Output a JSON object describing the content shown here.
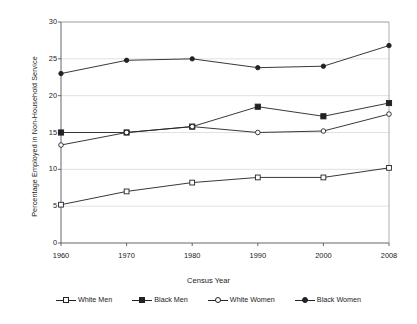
{
  "chart_data": {
    "type": "line",
    "title": "",
    "xlabel": "Census Year",
    "ylabel": "Percentage Employed in Non-Household Service",
    "categories": [
      "1960",
      "1970",
      "1980",
      "1990",
      "2000",
      "2008"
    ],
    "x": [
      1960,
      1970,
      1980,
      1990,
      2000,
      2008
    ],
    "ylim": [
      0,
      30
    ],
    "yticks": [
      "0",
      "5",
      "10",
      "15",
      "20",
      "25",
      "30"
    ],
    "ytick_values": [
      0,
      5,
      10,
      15,
      20,
      25,
      30
    ],
    "grid": true,
    "legend_position": "bottom",
    "series": [
      {
        "name": "White Men",
        "marker": "square-open",
        "color": "#222222",
        "values": [
          5.2,
          7.0,
          8.2,
          8.9,
          8.9,
          10.2
        ]
      },
      {
        "name": "Black Men",
        "marker": "square-filled",
        "color": "#222222",
        "values": [
          15.0,
          15.0,
          15.8,
          18.5,
          17.2,
          19.0
        ]
      },
      {
        "name": "White Women",
        "marker": "circle-open",
        "color": "#222222",
        "values": [
          13.3,
          15.0,
          15.8,
          15.0,
          15.2,
          17.5
        ]
      },
      {
        "name": "Black Women",
        "marker": "circle-filled",
        "color": "#222222",
        "values": [
          23.0,
          24.8,
          25.0,
          23.8,
          24.0,
          26.8
        ]
      }
    ]
  },
  "axis": {
    "y_title": "Percentage Employed in Non-Household Service",
    "x_title": "Census Year"
  },
  "legend": {
    "items": [
      {
        "label": "White Men",
        "marker": "square-open"
      },
      {
        "label": "Black Men",
        "marker": "square-filled"
      },
      {
        "label": "White Women",
        "marker": "circle-open"
      },
      {
        "label": "Black Women",
        "marker": "circle-filled"
      }
    ]
  },
  "colors": {
    "ink": "#222222",
    "grid": "#d9d9d9",
    "frame": "#9a9a9a",
    "background": "#ffffff"
  }
}
